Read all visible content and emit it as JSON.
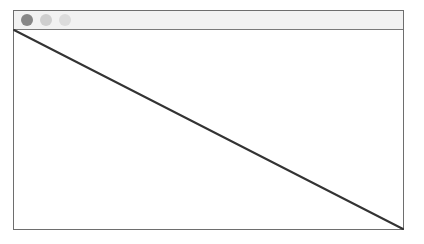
{
  "window": {
    "title": "",
    "controls": [
      {
        "name": "close",
        "color": "#878787"
      },
      {
        "name": "minimize",
        "color": "#cfcfcf"
      },
      {
        "name": "maximize",
        "color": "#dcdcdc"
      }
    ]
  },
  "content": {
    "shape": "diagonal-line",
    "line": {
      "from": "top-left",
      "to": "bottom-right",
      "color": "#333333",
      "width": 2
    }
  }
}
